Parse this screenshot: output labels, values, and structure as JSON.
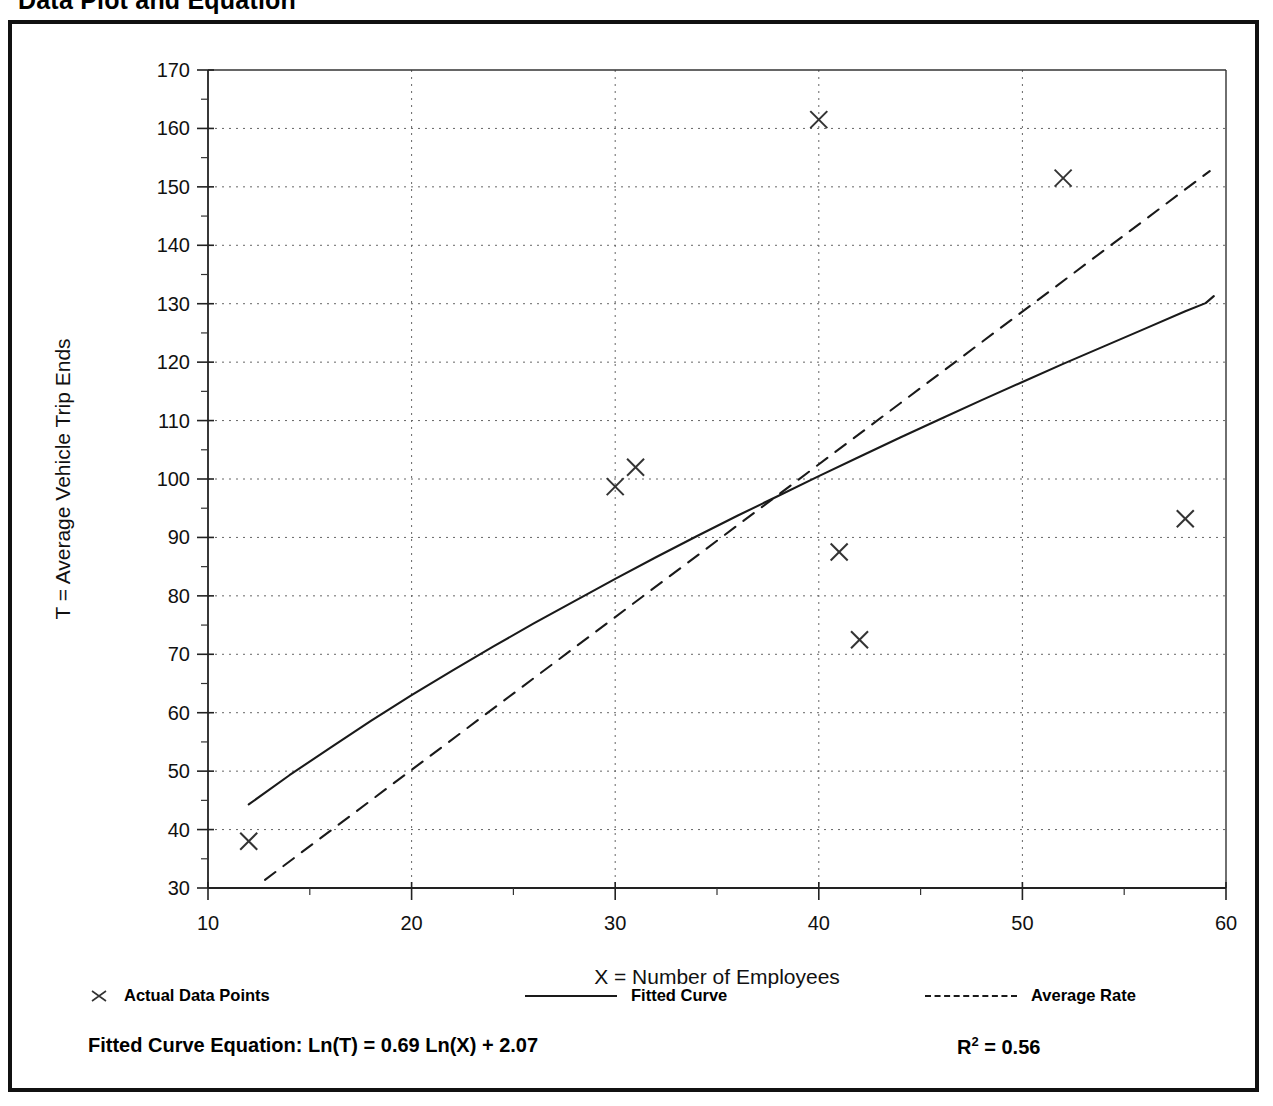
{
  "page": {
    "title": "Data Plot and Equation"
  },
  "legend": {
    "items": [
      {
        "label": "Actual Data Points",
        "swatch": "marker-x-icon"
      },
      {
        "label": "Fitted Curve",
        "swatch": "solid-line-icon"
      },
      {
        "label": "Average Rate",
        "swatch": "dashed-line-icon"
      }
    ]
  },
  "footer": {
    "equation": "Fitted Curve Equation:  Ln(T) = 0.69 Ln(X) + 2.07",
    "r_squared_label": "R",
    "r_squared_exponent": "2",
    "r_squared_value": " = 0.56"
  },
  "chart_data": {
    "type": "scatter",
    "title": "Data Plot and Equation",
    "xlabel": "X = Number of Employees",
    "ylabel": "T = Average Vehicle Trip Ends",
    "xlim": [
      10,
      60
    ],
    "ylim": [
      30,
      170
    ],
    "xticks": [
      10,
      20,
      30,
      40,
      50,
      60
    ],
    "xtick_labels": [
      "10",
      "20",
      "30",
      "40",
      "50",
      "60"
    ],
    "xminor_step": 5,
    "yticks": [
      30,
      40,
      50,
      60,
      70,
      80,
      90,
      100,
      110,
      120,
      130,
      140,
      150,
      160,
      170
    ],
    "ytick_labels": [
      "30",
      "40",
      "50",
      "60",
      "70",
      "80",
      "90",
      "100",
      "110",
      "120",
      "130",
      "140",
      "150",
      "160",
      "170"
    ],
    "yminor_step": 5,
    "grid": true,
    "grid_style": "dotted",
    "legend_position": "below-axes",
    "series": [
      {
        "name": "Actual Data Points",
        "type": "scatter",
        "marker": "x",
        "color": "#333333",
        "points": [
          {
            "x": 12,
            "y": 38
          },
          {
            "x": 30,
            "y": 98.7
          },
          {
            "x": 31,
            "y": 102
          },
          {
            "x": 40,
            "y": 161.5
          },
          {
            "x": 41,
            "y": 87.5
          },
          {
            "x": 42,
            "y": 72.5
          },
          {
            "x": 52,
            "y": 151.5
          },
          {
            "x": 58,
            "y": 93.2
          }
        ]
      },
      {
        "name": "Fitted Curve",
        "type": "line",
        "style": "solid",
        "color": "#1a1a1a",
        "equation": "Ln(T) = 0.69 Ln(X) + 2.07",
        "points": [
          {
            "x": 12,
            "y": 44.3
          },
          {
            "x": 14,
            "y": 49.3
          },
          {
            "x": 16,
            "y": 54.0
          },
          {
            "x": 18,
            "y": 58.6
          },
          {
            "x": 20,
            "y": 63.0
          },
          {
            "x": 22,
            "y": 67.2
          },
          {
            "x": 24,
            "y": 71.3
          },
          {
            "x": 26,
            "y": 75.3
          },
          {
            "x": 28,
            "y": 79.1
          },
          {
            "x": 30,
            "y": 82.9
          },
          {
            "x": 32,
            "y": 86.6
          },
          {
            "x": 34,
            "y": 90.2
          },
          {
            "x": 36,
            "y": 93.7
          },
          {
            "x": 38,
            "y": 97.1
          },
          {
            "x": 40,
            "y": 100.5
          },
          {
            "x": 42,
            "y": 103.8
          },
          {
            "x": 44,
            "y": 107.1
          },
          {
            "x": 46,
            "y": 110.3
          },
          {
            "x": 48,
            "y": 113.5
          },
          {
            "x": 50,
            "y": 116.6
          },
          {
            "x": 52,
            "y": 119.7
          },
          {
            "x": 54,
            "y": 122.7
          },
          {
            "x": 56,
            "y": 125.7
          },
          {
            "x": 58,
            "y": 128.7
          },
          {
            "x": 59,
            "y": 130.1
          },
          {
            "x": 59.4,
            "y": 131.3
          }
        ]
      },
      {
        "name": "Average Rate",
        "type": "line",
        "style": "dashed",
        "color": "#1a1a1a",
        "points": [
          {
            "x": 12.8,
            "y": 31.4
          },
          {
            "x": 59.2,
            "y": 152.7
          }
        ]
      }
    ]
  }
}
